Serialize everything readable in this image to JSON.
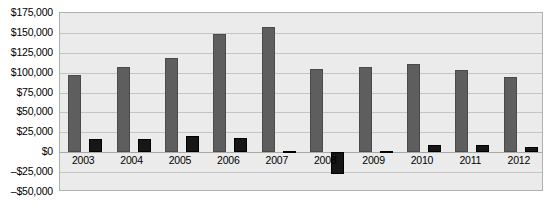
{
  "chart_data": {
    "type": "bar",
    "title": "",
    "subtitle": "",
    "xlabel": "",
    "ylabel": "",
    "categories": [
      "2003",
      "2004",
      "2005",
      "2006",
      "2007",
      "2008",
      "2009",
      "2010",
      "2011",
      "2012"
    ],
    "series": [
      {
        "name": "Series 1",
        "color": "#5e5e5e",
        "values": [
          97000,
          107000,
          119000,
          148000,
          157000,
          105000,
          107000,
          111000,
          103000,
          95000
        ]
      },
      {
        "name": "Series 2",
        "color": "#161616",
        "values": [
          17000,
          16000,
          20000,
          18000,
          2000,
          -27000,
          1000,
          9000,
          9000,
          6000
        ]
      }
    ],
    "ylim": [
      -50000,
      175000
    ],
    "ytick_values": [
      175000,
      150000,
      125000,
      100000,
      75000,
      50000,
      25000,
      0,
      -25000,
      -50000
    ],
    "ytick_labels": [
      "$175,000",
      "$150,000",
      "$125,000",
      "$100,000",
      "$75,000",
      "$50,000",
      "$25,000",
      "$0",
      "–$25,000",
      "–$50,000"
    ],
    "grid": true,
    "legend": "none",
    "legend_position": "none",
    "plot_background": "#ebebeb",
    "grid_color": "#c4c4c4",
    "border_color": "#b0b0b0"
  }
}
